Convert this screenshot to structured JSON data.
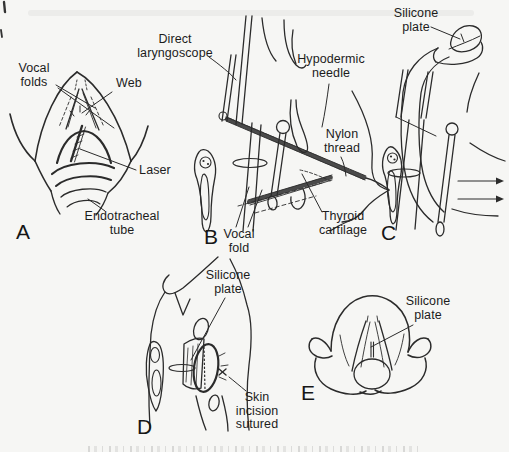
{
  "figure": {
    "type": "scanned-medical-illustration"
  },
  "colors": {
    "background": "#f6f6f4",
    "line": "#2b2b2b",
    "text": "#1c1c1c"
  },
  "panels": {
    "a": {
      "letter": "A",
      "labels": {
        "vocal_folds": "Vocal\nfolds",
        "web": "Web",
        "laser": "Laser",
        "endotracheal_tube": "Endotracheal\ntube"
      }
    },
    "b": {
      "letter": "B",
      "labels": {
        "direct_laryngoscope": "Direct\nlaryngoscope",
        "hypodermic_needle": "Hypodermic\nneedle",
        "nylon_thread": "Nylon\nthread",
        "thyroid_cartilage": "Thyroid\ncartilage",
        "vocal_fold": "Vocal\nfold"
      }
    },
    "c": {
      "letter": "C",
      "labels": {
        "silicone_plate": "Silicone\nplate"
      }
    },
    "d": {
      "letter": "D",
      "labels": {
        "silicone_plate": "Silicone\nplate",
        "skin_incision_sutured": "Skin\nincision\nsutured"
      }
    },
    "e": {
      "letter": "E",
      "labels": {
        "silicone_plate": "Silicone\nplate"
      }
    }
  }
}
